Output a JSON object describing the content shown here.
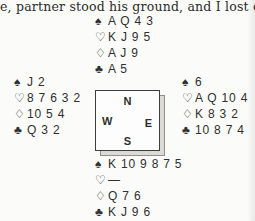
{
  "page": {
    "top_text": "e, partner stood his ground, and I lost onl"
  },
  "diagram": {
    "suits": {
      "spade": "♠",
      "heart": "♡",
      "diamond": "♢",
      "club": "♣"
    },
    "compass": {
      "north": "N",
      "east": "E",
      "south": "S",
      "west": "W"
    },
    "hands": {
      "north": {
        "spades": "A Q 4 3",
        "hearts": "K J 9 5",
        "diamonds": "A J 9",
        "clubs": "A 5"
      },
      "west": {
        "spades": "J 2",
        "hearts": "8 7 6 3 2",
        "diamonds": "10 5 4",
        "clubs": "Q 3 2"
      },
      "east": {
        "spades": "6",
        "hearts": "A Q 10 4",
        "diamonds": "K 8 3 2",
        "clubs": "10 8 7 4"
      },
      "south": {
        "spades": "K 10 9 8 7 5",
        "hearts": "—",
        "diamonds": "Q 7 6",
        "clubs": "K J 9 6"
      }
    }
  },
  "colors": {
    "background": "#fbfbfa",
    "text": "#2f2f2f",
    "box_border": "#3e3e3e",
    "box_shadow_fill": "#dcdad5"
  }
}
